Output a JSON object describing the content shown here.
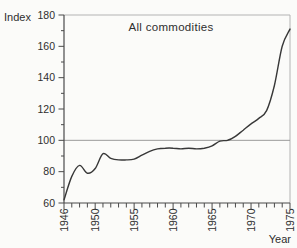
{
  "labels": {
    "index_axis": "Index",
    "year_axis": "Year"
  },
  "chart_data": {
    "type": "line",
    "title": "All commodities",
    "xlabel": "Year",
    "ylabel": "Index",
    "x": [
      1946,
      1947,
      1948,
      1949,
      1950,
      1951,
      1952,
      1953,
      1954,
      1955,
      1956,
      1957,
      1958,
      1959,
      1960,
      1961,
      1962,
      1963,
      1964,
      1965,
      1966,
      1967,
      1968,
      1969,
      1970,
      1971,
      1972,
      1973,
      1974,
      1975
    ],
    "values": [
      62,
      77,
      84,
      79,
      82,
      91.5,
      88.5,
      87.5,
      87.5,
      88,
      90.5,
      93,
      94.5,
      95,
      95,
      94.5,
      95,
      94.5,
      95,
      96.5,
      99.5,
      100,
      102.5,
      106.5,
      110.5,
      114,
      119,
      135,
      160,
      171
    ],
    "xlim": [
      1946,
      1975
    ],
    "ylim": [
      60,
      180
    ],
    "yticks": [
      60,
      80,
      100,
      120,
      140,
      160,
      180
    ],
    "y_minor_ticks": [
      70,
      90,
      110,
      130,
      150,
      170
    ],
    "xticks": [
      1946,
      1950,
      1955,
      1960,
      1965,
      1970,
      1975
    ],
    "x_minor_tick_interval": 1,
    "reference_line_y": 100,
    "grid": "off",
    "legend": "none",
    "colors": {
      "line": "#383838",
      "axis": "#4a4a4a",
      "frame": "#b3b3b3",
      "reference_line": "#9a9a9a",
      "text": "#2e2e2e",
      "background": "#fbfbf9"
    }
  }
}
